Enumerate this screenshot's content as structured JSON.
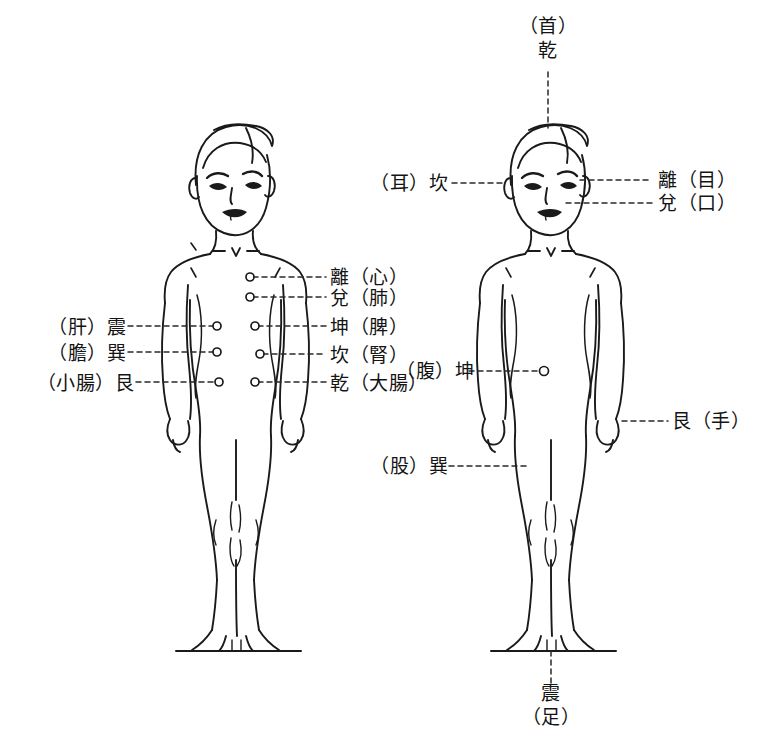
{
  "meta": {
    "background_color": "#ffffff",
    "ink_color": "#1a1a1a",
    "figure_count": 2,
    "figure_left_name": "正面人體圖（臟腑對應）",
    "figure_right_name": "正面人體圖（部位對應）"
  },
  "labels": {
    "top": {
      "line1": "（首）",
      "line2": "乾"
    },
    "bottom": {
      "line1": "震",
      "line2": "（足）"
    },
    "head_left": "（耳）坎",
    "head_right_eye": "離（目）",
    "head_right_mouth": "兌（口）",
    "center_column": [
      {
        "text": "離（心）",
        "organ": "心",
        "trigram": "離"
      },
      {
        "text": "兌（肺）",
        "organ": "肺",
        "trigram": "兌"
      },
      {
        "text": "坤（脾）",
        "organ": "脾",
        "trigram": "坤"
      },
      {
        "text": "坎（腎）",
        "organ": "腎",
        "trigram": "坎"
      },
      {
        "text": "乾（大腸）",
        "organ": "大腸",
        "trigram": "乾"
      }
    ],
    "left_column": [
      {
        "text": "（肝）震",
        "organ": "肝",
        "trigram": "震"
      },
      {
        "text": "（膽）巽",
        "organ": "膽",
        "trigram": "巽"
      },
      {
        "text": "（小腸）艮",
        "organ": "小腸",
        "trigram": "艮"
      }
    ],
    "right_figure": {
      "abdomen": "（腹）坤",
      "hand": "艮（手）",
      "thigh": "（股）巽"
    }
  },
  "markers": {
    "point_count_left_figure": 8,
    "point_count_right_figure": 1,
    "point_shape": "small-circle"
  }
}
